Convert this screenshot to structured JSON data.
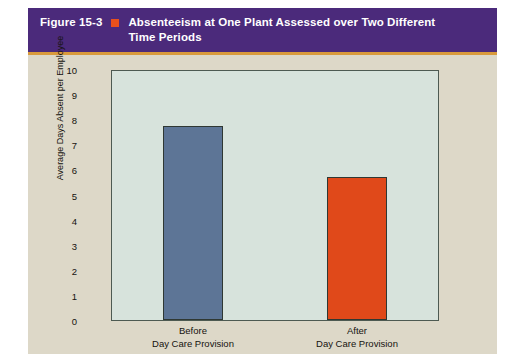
{
  "figure": {
    "number": "Figure 15-3",
    "bullet_icon": "orange-square-bullet",
    "title": "Absenteeism at One Plant Assessed over Two Different Time Periods",
    "header_color": "#4b2a7b",
    "rule_color": "#d99a3c",
    "background_color": "#ddd8c8"
  },
  "chart_data": {
    "type": "bar",
    "title": "Absenteeism at One Plant Assessed over Two Different Time Periods",
    "categories": [
      "Before Day Care Provision",
      "After Day Care Provision"
    ],
    "category_lines": [
      {
        "line1": "Before",
        "line2": "Day Care Provision"
      },
      {
        "line1": "After",
        "line2": "Day Care Provision"
      }
    ],
    "values": [
      7.75,
      5.75
    ],
    "bar_colors": [
      "#5d7596",
      "#e0491a"
    ],
    "xlabel": "",
    "ylabel": "Average Days Absent per Employee",
    "ylim": [
      0,
      10
    ],
    "ytick_step": 1,
    "yticks": [
      "10",
      "9",
      "8",
      "7",
      "6",
      "5",
      "4",
      "3",
      "2",
      "1",
      "0"
    ],
    "grid": false,
    "legend": false,
    "plot_background": "#d7e3dc",
    "axis_color": "#4d5a52"
  }
}
